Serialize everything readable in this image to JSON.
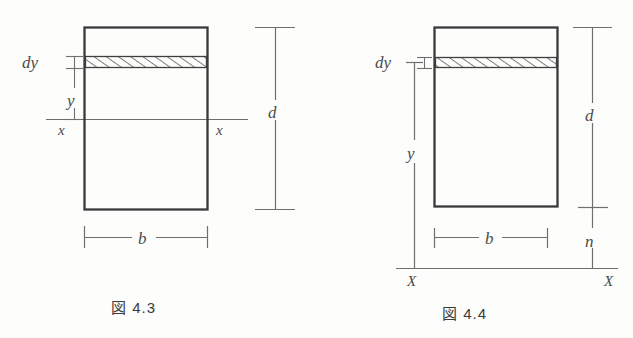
{
  "diagram": {
    "background_color": "#fdfdfc",
    "ink_color": "#3a3a3a",
    "thin_line_color": "#6b6b6b",
    "figures": [
      {
        "id": "figure-4-3",
        "caption": "図 4.3",
        "caption_kanji": "図",
        "caption_number": "4.3",
        "section_label": "図 4.3",
        "rect": {
          "x": 84,
          "y": 27,
          "width": 124,
          "height": 183
        },
        "hatched_strip": {
          "x": 84,
          "y": 56,
          "width": 124,
          "height": 12
        },
        "labels": {
          "dy": "dy",
          "y": "y",
          "x_left": "x",
          "x_right": "x",
          "d": "d",
          "b": "b"
        },
        "axis_line": {
          "name": "x-x-neutral-axis",
          "y": 119,
          "x_start": 46,
          "x_end": 248
        },
        "dimensions": [
          {
            "name": "dy",
            "label": "dy",
            "orientation": "vertical",
            "from_y": 56,
            "to_y": 68,
            "at_x": 74
          },
          {
            "name": "y",
            "label": "y",
            "orientation": "vertical",
            "from_y": 62,
            "to_y": 119,
            "at_x": 74
          },
          {
            "name": "d",
            "label": "d",
            "orientation": "vertical",
            "from_y": 27,
            "to_y": 210,
            "at_x": 275
          },
          {
            "name": "b",
            "label": "b",
            "orientation": "horizontal",
            "from_x": 84,
            "to_x": 208,
            "at_y": 237
          }
        ]
      },
      {
        "id": "figure-4-4",
        "caption": "図 4.4",
        "caption_kanji": "図",
        "caption_number": "4.4",
        "section_label": "図 4.4",
        "rect": {
          "x": 434,
          "y": 27,
          "width": 124,
          "height": 180
        },
        "hatched_strip": {
          "x": 434,
          "y": 57,
          "width": 124,
          "height": 11
        },
        "labels": {
          "dy": "dy",
          "y": "y",
          "d": "d",
          "n": "n",
          "b": "b",
          "X_left": "X",
          "X_right": "X"
        },
        "baseline": {
          "name": "X-X-reference-axis",
          "y": 268,
          "x_start": 396,
          "x_end": 618
        },
        "dimensions": [
          {
            "name": "dy",
            "label": "dy",
            "orientation": "vertical",
            "from_y": 57,
            "to_y": 68,
            "at_x": 424
          },
          {
            "name": "y",
            "label": "y",
            "orientation": "vertical",
            "from_y": 62,
            "to_y": 268,
            "at_x": 415
          },
          {
            "name": "d",
            "label": "d",
            "orientation": "vertical",
            "from_y": 27,
            "to_y": 207,
            "at_x": 592
          },
          {
            "name": "n",
            "label": "n",
            "orientation": "vertical",
            "from_y": 207,
            "to_y": 268,
            "at_x": 592
          },
          {
            "name": "b",
            "label": "b",
            "orientation": "horizontal",
            "from_x": 434,
            "to_x": 548,
            "at_y": 237
          }
        ]
      }
    ]
  }
}
